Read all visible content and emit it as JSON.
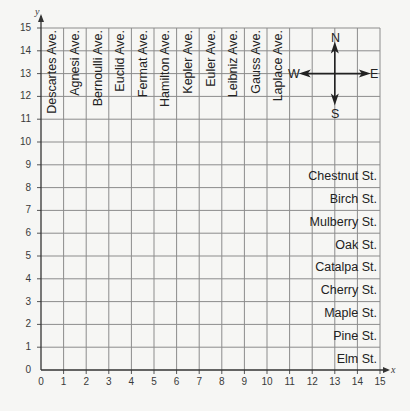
{
  "chart_data": {
    "type": "grid-map",
    "title": "",
    "xlabel": "x",
    "ylabel": "y",
    "xlim": [
      0,
      15
    ],
    "ylim": [
      0,
      15
    ],
    "grid": true,
    "x_ticks": [
      "0",
      "1",
      "2",
      "3",
      "4",
      "5",
      "6",
      "7",
      "8",
      "9",
      "10",
      "11",
      "12",
      "13",
      "14",
      "15"
    ],
    "y_ticks": [
      "0",
      "1",
      "2",
      "3",
      "4",
      "5",
      "6",
      "7",
      "8",
      "9",
      "10",
      "11",
      "12",
      "13",
      "14",
      "15"
    ],
    "avenues": [
      {
        "name": "Descartes Ave.",
        "x": 0.5
      },
      {
        "name": "Agnesi Ave.",
        "x": 1.5
      },
      {
        "name": "Bernoulli Ave.",
        "x": 2.5
      },
      {
        "name": "Euclid Ave.",
        "x": 3.5
      },
      {
        "name": "Fermat Ave.",
        "x": 4.5
      },
      {
        "name": "Hamilton Ave.",
        "x": 5.5
      },
      {
        "name": "Kepler Ave.",
        "x": 6.5
      },
      {
        "name": "Euler Ave.",
        "x": 7.5
      },
      {
        "name": "Leibniz Ave.",
        "x": 8.5
      },
      {
        "name": "Gauss Ave.",
        "x": 9.5
      },
      {
        "name": "Laplace Ave.",
        "x": 10.5
      }
    ],
    "streets": [
      {
        "name": "Chestnut St.",
        "y": 8.5
      },
      {
        "name": "Birch St.",
        "y": 7.5
      },
      {
        "name": "Mulberry St.",
        "y": 6.5
      },
      {
        "name": "Oak St.",
        "y": 5.5
      },
      {
        "name": "Catalpa St.",
        "y": 4.5
      },
      {
        "name": "Cherry St.",
        "y": 3.5
      },
      {
        "name": "Maple St.",
        "y": 2.5
      },
      {
        "name": "Pine St.",
        "y": 1.5
      },
      {
        "name": "Elm St.",
        "y": 0.5
      }
    ],
    "compass": {
      "center": [
        13,
        13
      ],
      "N": "N",
      "S": "S",
      "E": "E",
      "W": "W"
    }
  },
  "axes": {
    "x_name": "x",
    "y_name": "y"
  },
  "compass_labels": {
    "n": "N",
    "s": "S",
    "e": "E",
    "w": "W"
  }
}
